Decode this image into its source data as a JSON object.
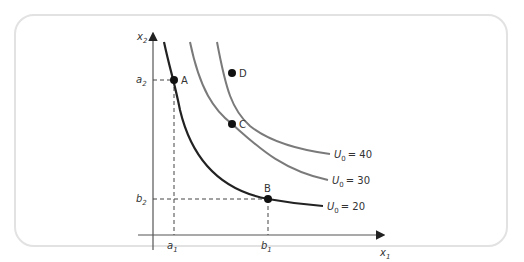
{
  "diagram": {
    "axes": {
      "x_label": "x",
      "x_sub": "1",
      "y_label": "x",
      "y_sub": "2"
    },
    "curves": [
      {
        "name": "U0=20",
        "label_main": "U",
        "label_sub": "0",
        "label_value": "= 20",
        "color": "#222222"
      },
      {
        "name": "U0=30",
        "label_main": "U",
        "label_sub": "0",
        "label_value": "= 30",
        "color": "#7a7a7a"
      },
      {
        "name": "U0=40",
        "label_main": "U",
        "label_sub": "0",
        "label_value": "= 40",
        "color": "#7a7a7a"
      }
    ],
    "points": [
      {
        "label": "A",
        "curve": "U0=20"
      },
      {
        "label": "B",
        "curve": "U0=20"
      },
      {
        "label": "C",
        "curve": "U0=30"
      },
      {
        "label": "D",
        "curve": "U0=40"
      }
    ],
    "ticks": {
      "a1": {
        "main": "a",
        "sub": "1"
      },
      "b1": {
        "main": "b",
        "sub": "1"
      },
      "a2": {
        "main": "a",
        "sub": "2"
      },
      "b2": {
        "main": "b",
        "sub": "2"
      }
    }
  }
}
